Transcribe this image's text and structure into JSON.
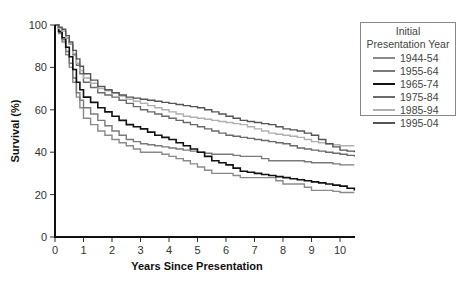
{
  "chart_data": {
    "type": "line",
    "title": "",
    "xlabel": "Years Since Presentation",
    "ylabel": "Survival (%)",
    "xlim": [
      0,
      10.5
    ],
    "ylim": [
      0,
      100
    ],
    "x_ticks": [
      "0",
      "1",
      "2",
      "3",
      "4",
      "5",
      "6",
      "7",
      "8",
      "9",
      "10"
    ],
    "y_ticks": [
      "0",
      "20",
      "40",
      "60",
      "80",
      "100"
    ],
    "grid": false,
    "legend_position": "top-right",
    "legend_title": "Initial Presentation Year",
    "x": [
      0,
      0.25,
      0.5,
      0.75,
      1,
      1.5,
      2,
      2.5,
      3,
      3.5,
      4,
      4.5,
      5,
      5.5,
      6,
      6.5,
      7,
      7.5,
      8,
      8.5,
      9,
      9.5,
      10,
      10.5
    ],
    "series": [
      {
        "name": "1944-54",
        "color": "#8a8a8a",
        "values": [
          100,
          92,
          80,
          66,
          56,
          50,
          46,
          43,
          40,
          40,
          38,
          36,
          33,
          30,
          30,
          28,
          28,
          28,
          25,
          25,
          22,
          22,
          21,
          21
        ]
      },
      {
        "name": "1955-64",
        "color": "#7a7a7a",
        "values": [
          100,
          93,
          82,
          68,
          61,
          55,
          50,
          46,
          44,
          43,
          42,
          41,
          40,
          39,
          39,
          38,
          38,
          36,
          36,
          36,
          35,
          35,
          34,
          34
        ]
      },
      {
        "name": "1965-74",
        "color": "#111111",
        "values": [
          100,
          94,
          85,
          73,
          66,
          61,
          57,
          53,
          51,
          48,
          46,
          43,
          40,
          36,
          34,
          31,
          30,
          29,
          28,
          27,
          26,
          25,
          24,
          22
        ]
      },
      {
        "name": "1975-84",
        "color": "#6a6a6a",
        "values": [
          100,
          97,
          91,
          81,
          73,
          68,
          66,
          63,
          60,
          58,
          56,
          54,
          52,
          50,
          48,
          47,
          46,
          45,
          44,
          42,
          41,
          40,
          39,
          38
        ]
      },
      {
        "name": "1985-94",
        "color": "#b0b0b0",
        "values": [
          100,
          97,
          91,
          82,
          75,
          70,
          68,
          65,
          63,
          61,
          59,
          57,
          56,
          55,
          54,
          53,
          51,
          49,
          48,
          47,
          45,
          44,
          43,
          43
        ]
      },
      {
        "name": "1995-04",
        "color": "#555555",
        "values": [
          100,
          98,
          92,
          84,
          77,
          71,
          68,
          66,
          65,
          64,
          63,
          62,
          61,
          59,
          57,
          55,
          54,
          53,
          51,
          50,
          48,
          44,
          41,
          40
        ]
      }
    ]
  }
}
